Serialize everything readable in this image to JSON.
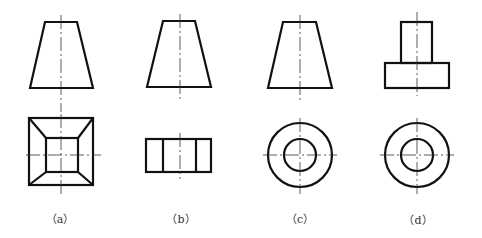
{
  "figure": {
    "type": "orthographic-projection-comparison",
    "views": [
      {
        "id": "a",
        "label": "（a）",
        "front": "trapezoid",
        "top": "square with inner square, corners joined (frustum of square pyramid)"
      },
      {
        "id": "b",
        "label": "（b）",
        "front": "trapezoid",
        "top": "rectangle divided into three vertical bands"
      },
      {
        "id": "c",
        "label": "（c）",
        "front": "trapezoid",
        "top": "two concentric circles (frustum of cone)"
      },
      {
        "id": "d",
        "label": "（d）",
        "front": "two stacked rectangles (stepped cylinder)",
        "top": "two concentric circles"
      }
    ]
  },
  "colors": {
    "line": "#111111",
    "centerline": "#333333",
    "background": "#ffffff"
  }
}
